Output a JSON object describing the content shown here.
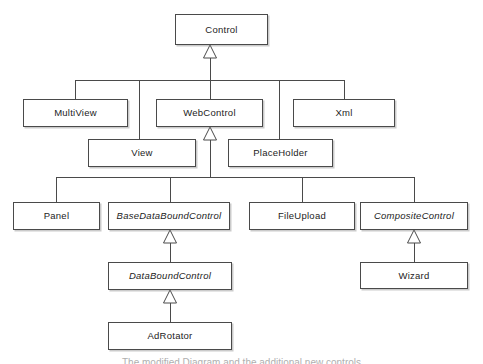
{
  "diagram": {
    "kind": "uml-class-hierarchy",
    "style": {
      "background": "#ffffff",
      "box_fill": "#ffffff",
      "box_stroke": "#4a4a4a",
      "line_color": "#4a4a4a",
      "text_color": "#232323",
      "shadow_color": "#828282"
    },
    "nodes": [
      {
        "id": "control",
        "label": "Control",
        "abstract": false,
        "x": 175,
        "y": 14,
        "w": 93,
        "h": 31
      },
      {
        "id": "multiview",
        "label": "MultiView",
        "abstract": false,
        "x": 23,
        "y": 99,
        "w": 105,
        "h": 28
      },
      {
        "id": "webcontrol",
        "label": "WebControl",
        "abstract": false,
        "x": 156,
        "y": 99,
        "w": 107,
        "h": 28
      },
      {
        "id": "xml",
        "label": "Xml",
        "abstract": false,
        "x": 293,
        "y": 99,
        "w": 102,
        "h": 28
      },
      {
        "id": "view",
        "label": "View",
        "abstract": false,
        "x": 88,
        "y": 139,
        "w": 108,
        "h": 28
      },
      {
        "id": "placeholder",
        "label": "PlaceHolder",
        "abstract": false,
        "x": 228,
        "y": 139,
        "w": 105,
        "h": 28
      },
      {
        "id": "panel",
        "label": "Panel",
        "abstract": false,
        "x": 13,
        "y": 202,
        "w": 87,
        "h": 28
      },
      {
        "id": "basedataboundcontrol",
        "label": "BaseDataBoundControl",
        "abstract": true,
        "x": 108,
        "y": 202,
        "w": 122,
        "h": 28
      },
      {
        "id": "fileupload",
        "label": "FileUpload",
        "abstract": false,
        "x": 249,
        "y": 202,
        "w": 106,
        "h": 28
      },
      {
        "id": "compositecontrol",
        "label": "CompositeControl",
        "abstract": true,
        "x": 360,
        "y": 202,
        "w": 108,
        "h": 28
      },
      {
        "id": "databoundcontrol",
        "label": "DataBoundControl",
        "abstract": true,
        "x": 108,
        "y": 262,
        "w": 124,
        "h": 28
      },
      {
        "id": "wizard",
        "label": "Wizard",
        "abstract": false,
        "x": 360,
        "y": 262,
        "w": 108,
        "h": 27
      },
      {
        "id": "adrotator",
        "label": "AdRotator",
        "abstract": false,
        "x": 108,
        "y": 322,
        "w": 124,
        "h": 28
      }
    ],
    "generalizations": [
      {
        "child": "multiview",
        "parent": "control"
      },
      {
        "child": "webcontrol",
        "parent": "control"
      },
      {
        "child": "xml",
        "parent": "control"
      },
      {
        "child": "view",
        "parent": "control"
      },
      {
        "child": "placeholder",
        "parent": "control"
      },
      {
        "child": "panel",
        "parent": "webcontrol"
      },
      {
        "child": "basedataboundcontrol",
        "parent": "webcontrol"
      },
      {
        "child": "fileupload",
        "parent": "webcontrol"
      },
      {
        "child": "compositecontrol",
        "parent": "webcontrol"
      },
      {
        "child": "databoundcontrol",
        "parent": "basedataboundcontrol"
      },
      {
        "child": "adrotator",
        "parent": "databoundcontrol"
      },
      {
        "child": "wizard",
        "parent": "compositecontrol"
      }
    ],
    "edges": {
      "control_bus": {
        "y": 80,
        "x_left": 75,
        "x_right": 344,
        "drops": [
          75,
          139,
          210,
          279,
          344
        ],
        "riser_x": 210,
        "riser_top": 53
      },
      "webcontrol_bus": {
        "y": 177,
        "x_left": 56,
        "x_right": 414,
        "drops": [
          56,
          170,
          302,
          414
        ],
        "riser_x": 210,
        "riser_top": 135
      },
      "direct": [
        {
          "x": 170,
          "y_top": 238,
          "y_bottom": 262
        },
        {
          "x": 170,
          "y_top": 298,
          "y_bottom": 322
        },
        {
          "x": 414,
          "y_top": 238,
          "y_bottom": 262
        }
      ],
      "arrowheads": [
        {
          "x": 210,
          "y": 45,
          "note": "into Control"
        },
        {
          "x": 210,
          "y": 127,
          "note": "into WebControl"
        },
        {
          "x": 170,
          "y": 230,
          "note": "into BaseDataBoundControl"
        },
        {
          "x": 170,
          "y": 290,
          "note": "into DataBoundControl"
        },
        {
          "x": 414,
          "y": 230,
          "note": "into CompositeControl"
        }
      ]
    }
  },
  "caption": {
    "text": "The modified Diagram and the additional new controls"
  }
}
